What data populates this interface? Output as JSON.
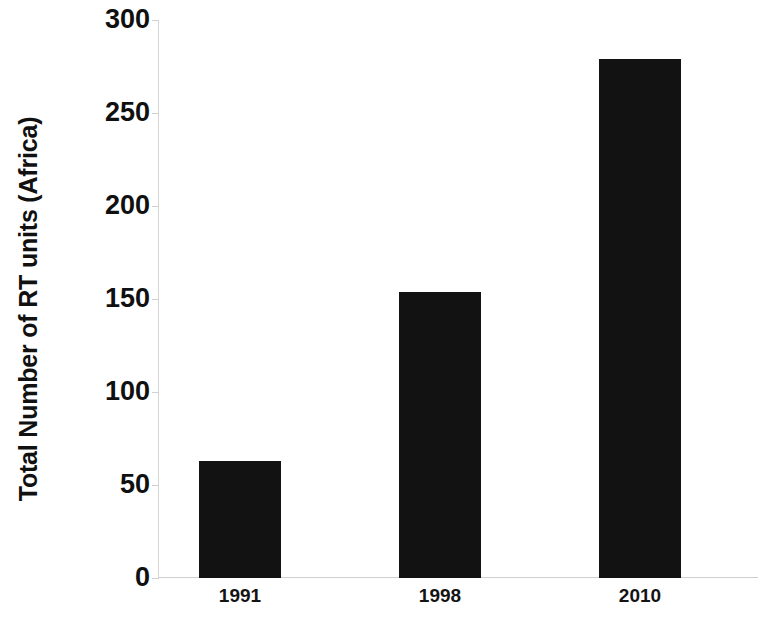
{
  "chart_data": {
    "type": "bar",
    "title": "",
    "subtitle": "",
    "xlabel": "",
    "ylabel": "Total Number of RT units (Africa)",
    "categories": [
      "1991",
      "1998",
      "2010"
    ],
    "values": [
      63,
      154,
      279
    ],
    "series": [
      {
        "name": "Total Number of RT units (Africa)",
        "values": [
          63,
          154,
          279
        ]
      }
    ],
    "ylim": [
      0,
      300
    ],
    "ytick_labels": [
      "0",
      "50",
      "100",
      "150",
      "200",
      "250",
      "300"
    ],
    "ytick_values": [
      0,
      50,
      100,
      150,
      200,
      250,
      300
    ],
    "xtick_labels": [
      "1991",
      "1998",
      "2010"
    ],
    "grid": false,
    "legend": false,
    "legend_position": "none",
    "bar_color": "#121212",
    "axis_color": "#d0d0d0",
    "background_color": "#ffffff"
  }
}
